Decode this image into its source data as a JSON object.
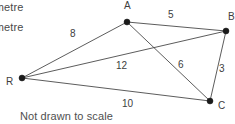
{
  "figure": {
    "type": "network-diagram",
    "scale_note": "Not drawn to scale",
    "axis_notes": [
      {
        "id": "note-1",
        "text": "lometre"
      },
      {
        "id": "note-2",
        "text": "lometre"
      }
    ]
  },
  "graph": {
    "nodes": [
      {
        "id": "A",
        "label": "A",
        "x": 127,
        "y": 22,
        "label_x": 124,
        "label_y": 9
      },
      {
        "id": "B",
        "label": "B",
        "x": 226,
        "y": 31,
        "label_x": 228,
        "label_y": 20
      },
      {
        "id": "C",
        "label": "C",
        "x": 210,
        "y": 101,
        "label_x": 218,
        "label_y": 109
      },
      {
        "id": "R",
        "label": "R",
        "x": 22,
        "y": 78,
        "label_x": 6,
        "label_y": 85
      }
    ],
    "edges": [
      {
        "id": "R-A",
        "from": "R",
        "to": "A",
        "weight": "8",
        "label_x": 70,
        "label_y": 37
      },
      {
        "id": "A-B",
        "from": "A",
        "to": "B",
        "weight": "5",
        "label_x": 168,
        "label_y": 18
      },
      {
        "id": "R-B",
        "from": "R",
        "to": "B",
        "weight": "12",
        "label_x": 116,
        "label_y": 69
      },
      {
        "id": "A-C",
        "from": "A",
        "to": "C",
        "weight": "6",
        "label_x": 178,
        "label_y": 68
      },
      {
        "id": "B-C",
        "from": "B",
        "to": "C",
        "weight": "3",
        "label_x": 219,
        "label_y": 72
      },
      {
        "id": "R-C",
        "from": "R",
        "to": "C",
        "weight": "10",
        "label_x": 122,
        "label_y": 107
      }
    ]
  },
  "colors": {
    "background": "#ffffff",
    "edge": "#4a4a4a",
    "node": "#1a1a1a",
    "text": "#3d3d3d"
  }
}
